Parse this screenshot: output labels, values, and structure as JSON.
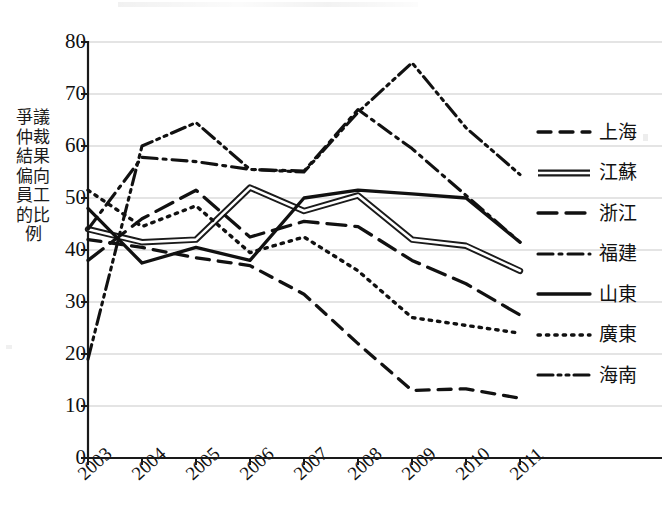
{
  "axes": {
    "y_title": "爭議仲裁結果偏向員工的比例",
    "y_ticks": [
      "80",
      "70",
      "60",
      "50",
      "40",
      "30",
      "20",
      "10",
      "0"
    ],
    "x_ticks": [
      "2003",
      "2004",
      "2005",
      "2006",
      "2007",
      "2008",
      "2009",
      "2010",
      "2011"
    ]
  },
  "legend": {
    "items": [
      {
        "label": "上海",
        "style": "dashed"
      },
      {
        "label": "江蘇",
        "style": "double-solid"
      },
      {
        "label": "浙江",
        "style": "long-dashed"
      },
      {
        "label": "福建",
        "style": "dash-dot"
      },
      {
        "label": "山東",
        "style": "solid"
      },
      {
        "label": "廣東",
        "style": "dotted"
      },
      {
        "label": "海南",
        "style": "dash-dot-dot"
      }
    ]
  },
  "chart_data": {
    "type": "line",
    "title": "",
    "xlabel": "",
    "ylabel": "爭議仲裁結果偏向員工的比例",
    "x": [
      "2003",
      "2004",
      "2005",
      "2006",
      "2007",
      "2008",
      "2009",
      "2010",
      "2011"
    ],
    "xlim": [
      2003,
      2011
    ],
    "ylim": [
      0,
      80
    ],
    "ytick_step": 10,
    "grid": "horizontal",
    "legend_position": "right",
    "series": [
      {
        "name": "上海",
        "style": "dashed",
        "values": [
          42.0,
          40.5,
          38.5,
          37.0,
          31.5,
          22.0,
          13.0,
          13.3,
          11.5
        ]
      },
      {
        "name": "江蘇",
        "style": "double-solid",
        "values": [
          44.0,
          41.5,
          42.0,
          52.0,
          47.5,
          50.5,
          42.0,
          40.8,
          36.0
        ]
      },
      {
        "name": "浙江",
        "style": "long-dashed",
        "values": [
          38.0,
          46.0,
          51.5,
          42.5,
          45.5,
          44.5,
          38.0,
          33.5,
          27.5
        ]
      },
      {
        "name": "福建",
        "style": "dash-dot",
        "values": [
          44.0,
          57.8,
          57.0,
          55.5,
          55.2,
          67.0,
          59.5,
          50.5,
          41.5
        ]
      },
      {
        "name": "山東",
        "style": "solid",
        "values": [
          48.0,
          37.5,
          40.5,
          38.0,
          50.0,
          51.5,
          50.8,
          50.0,
          41.5
        ]
      },
      {
        "name": "廣東",
        "style": "dotted",
        "values": [
          51.5,
          44.5,
          48.5,
          39.5,
          42.5,
          36.0,
          27.0,
          25.5,
          24.0
        ]
      },
      {
        "name": "海南",
        "style": "dash-dot-dot",
        "values": [
          19.0,
          60.0,
          64.5,
          55.5,
          55.0,
          66.5,
          76.0,
          63.5,
          54.5
        ]
      }
    ]
  },
  "plot_geometry": {
    "left": 88,
    "right": 520,
    "top": 42,
    "bottom": 458
  }
}
